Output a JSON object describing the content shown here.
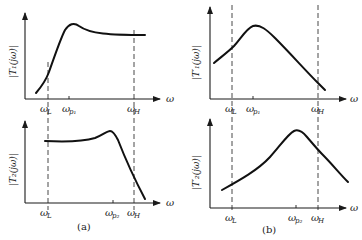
{
  "figure": {
    "panels": [
      {
        "id": "a",
        "caption": "(a)",
        "top": {
          "ylabel": "|T₁(jω)|",
          "xlabel": "ω",
          "ticks": [
            {
              "label": "ω",
              "sub": "L"
            },
            {
              "label": "ω",
              "sub": "p₁"
            },
            {
              "label": "ω",
              "sub": "H"
            }
          ]
        },
        "bottom": {
          "ylabel": "|T₂(jω)|",
          "xlabel": "ω",
          "ticks": [
            {
              "label": "ω",
              "sub": "L"
            },
            {
              "label": "ω",
              "sub": "p₂"
            },
            {
              "label": "ω",
              "sub": "H"
            }
          ]
        }
      },
      {
        "id": "b",
        "caption": "(b)",
        "top": {
          "ylabel": "|T′₁(jω)|",
          "xlabel": "ω",
          "ticks": [
            {
              "label": "ω",
              "sub": "L"
            },
            {
              "label": "ω",
              "sub": "p₁"
            },
            {
              "label": "ω",
              "sub": "H"
            }
          ]
        },
        "bottom": {
          "ylabel": "|T′₂(jω)|",
          "xlabel": "ω",
          "ticks": [
            {
              "label": "ω",
              "sub": "L"
            },
            {
              "label": "ω",
              "sub": "p₂"
            },
            {
              "label": "ω",
              "sub": "H"
            }
          ]
        }
      }
    ]
  }
}
